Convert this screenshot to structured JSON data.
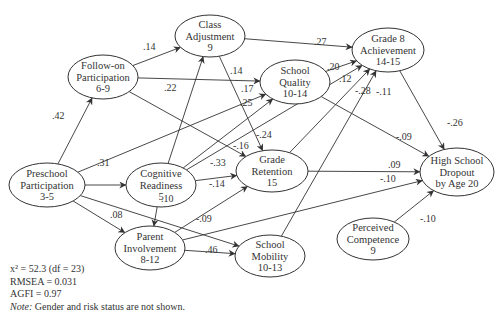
{
  "diagram": {
    "type": "path-model",
    "nodes": [
      {
        "id": "preschool",
        "lines": [
          "Preschool",
          "Participation",
          "3-5"
        ],
        "cx": 47,
        "cy": 185,
        "rx": 38,
        "ry": 22
      },
      {
        "id": "followon",
        "lines": [
          "Follow-on",
          "Participation",
          "6-9"
        ],
        "cx": 103,
        "cy": 77,
        "rx": 35,
        "ry": 22
      },
      {
        "id": "classadj",
        "lines": [
          "Class",
          "Adjustment",
          "9"
        ],
        "cx": 210,
        "cy": 36,
        "rx": 35,
        "ry": 21
      },
      {
        "id": "cogready",
        "lines": [
          "Cognitive",
          "Readiness",
          "5"
        ],
        "cx": 161,
        "cy": 185,
        "rx": 35,
        "ry": 22
      },
      {
        "id": "schoolquality",
        "lines": [
          "School",
          "Quality",
          "10-14"
        ],
        "cx": 295,
        "cy": 82,
        "rx": 35,
        "ry": 22
      },
      {
        "id": "grade8",
        "lines": [
          "Grade 8",
          "Achievement",
          "14-15"
        ],
        "cx": 388,
        "cy": 50,
        "rx": 36,
        "ry": 22
      },
      {
        "id": "retention",
        "lines": [
          "Grade",
          "Retention",
          "15"
        ],
        "cx": 272,
        "cy": 171,
        "rx": 36,
        "ry": 21
      },
      {
        "id": "dropout",
        "lines": [
          "High School",
          "Dropout",
          "by Age 20"
        ],
        "cx": 457,
        "cy": 172,
        "rx": 37,
        "ry": 24
      },
      {
        "id": "parent",
        "lines": [
          "Parent",
          "Involvement",
          "8-12"
        ],
        "cx": 150,
        "cy": 248,
        "rx": 35,
        "ry": 22
      },
      {
        "id": "mobility",
        "lines": [
          "School",
          "Mobility",
          "10-13"
        ],
        "cx": 270,
        "cy": 256,
        "rx": 35,
        "ry": 21
      },
      {
        "id": "competence",
        "lines": [
          "Perceived",
          "Competence",
          "9"
        ],
        "cx": 373,
        "cy": 239,
        "rx": 36,
        "ry": 21
      }
    ],
    "edges": [
      {
        "from": "preschool",
        "to": "followon",
        "coef": ".42",
        "lx": 52,
        "ly": 119
      },
      {
        "from": "preschool",
        "to": "cogready",
        "coef": ".31",
        "lx": 97,
        "ly": 166
      },
      {
        "from": "preschool",
        "to": "parent",
        "coef": ".08",
        "lx": 110,
        "ly": 218
      },
      {
        "from": "preschool",
        "to": "schoolquality",
        "coef": ".17",
        "lx": 241,
        "ly": 92
      },
      {
        "from": "preschool",
        "to": "mobility",
        "coef": "-.09",
        "lx": 196,
        "ly": 222
      },
      {
        "from": "followon",
        "to": "classadj",
        "coef": ".14",
        "lx": 143,
        "ly": 50
      },
      {
        "from": "followon",
        "to": "schoolquality",
        "coef": ".14",
        "lx": 230,
        "ly": 74
      },
      {
        "from": "followon",
        "to": "retention",
        "coef": "-.16",
        "lx": 233,
        "ly": 149
      },
      {
        "from": "classadj",
        "to": "grade8",
        "coef": ".27",
        "lx": 314,
        "ly": 45
      },
      {
        "from": "classadj",
        "to": "retention",
        "coef": "-.24",
        "lx": 256,
        "ly": 138
      },
      {
        "from": "cogready",
        "to": "classadj",
        "coef": ".22",
        "lx": 164,
        "ly": 91
      },
      {
        "from": "cogready",
        "to": "schoolquality",
        "coef": ".25",
        "lx": 240,
        "ly": 106
      },
      {
        "from": "cogready",
        "to": "grade8",
        "coef": ".12",
        "lx": 339,
        "ly": 82
      },
      {
        "from": "cogready",
        "to": "retention",
        "coef": "-.33",
        "lx": 210,
        "ly": 166
      },
      {
        "from": "cogready",
        "to": "parent",
        "coef": ".10",
        "lx": 161,
        "ly": 202
      },
      {
        "from": "schoolquality",
        "to": "grade8",
        "coef": ".20",
        "lx": 327,
        "ly": 70
      },
      {
        "from": "schoolquality",
        "to": "dropout",
        "coef": "-.09",
        "lx": 396,
        "ly": 140
      },
      {
        "from": "retention",
        "to": "grade8",
        "coef": "-.28",
        "lx": 355,
        "ly": 94
      },
      {
        "from": "retention",
        "to": "dropout",
        "coef": ".09",
        "lx": 388,
        "ly": 168
      },
      {
        "from": "parent",
        "to": "retention",
        "coef": "-.14",
        "lx": 209,
        "ly": 187
      },
      {
        "from": "parent",
        "to": "dropout",
        "coef": "-.10",
        "lx": 380,
        "ly": 182
      },
      {
        "from": "parent",
        "to": "mobility",
        "coef": ".46",
        "lx": 205,
        "ly": 253
      },
      {
        "from": "mobility",
        "to": "grade8",
        "coef": "-.11",
        "lx": 376,
        "ly": 95
      },
      {
        "from": "grade8",
        "to": "dropout",
        "coef": "-.26",
        "lx": 447,
        "ly": 126
      },
      {
        "from": "competence",
        "to": "dropout",
        "coef": "-.10",
        "lx": 420,
        "ly": 222
      }
    ]
  },
  "fit_stats": {
    "chi_square": "x² = 52.3 (df = 23)",
    "rmsea": "RMSEA = 0.031",
    "agfi": "AGFI = 0.97",
    "note_label": "Note:",
    "note_text": " Gender and risk status are not shown."
  }
}
